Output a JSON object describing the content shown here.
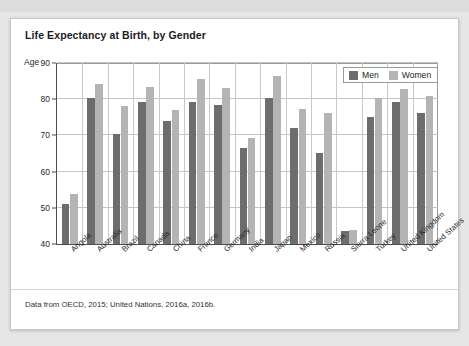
{
  "card": {
    "title": "Life Expectancy at Birth, by Gender",
    "footnote": "Data from OECD, 2015; United Nations, 2016a, 2016b."
  },
  "legend": {
    "items": [
      {
        "label": "Men",
        "color": "#6d6d6d"
      },
      {
        "label": "Women",
        "color": "#b4b4b4"
      }
    ]
  },
  "axis": {
    "y_label": "Age",
    "y_ticks": [
      "90",
      "80",
      "70",
      "60",
      "50",
      "40"
    ]
  },
  "chart_data": {
    "type": "bar",
    "title": "Life Expectancy at Birth, by Gender",
    "xlabel": "",
    "ylabel": "Age",
    "ylim": [
      40,
      90
    ],
    "yticks": [
      40,
      50,
      60,
      70,
      80,
      90
    ],
    "grid": true,
    "legend_position": "top-right",
    "categories": [
      "Angola",
      "Australia",
      "Brazil",
      "Canada",
      "China",
      "France",
      "Germany",
      "India",
      "Japan",
      "Mexico",
      "Russia",
      "Sierra Leone",
      "Turkey",
      "United Kingdom",
      "United States"
    ],
    "series": [
      {
        "name": "Men",
        "color": "#6d6d6d",
        "values": [
          51.0,
          80.2,
          70.5,
          79.2,
          74.1,
          79.2,
          78.5,
          66.4,
          80.3,
          72.1,
          65.2,
          43.6,
          75.0,
          79.2,
          76.1
        ]
      },
      {
        "name": "Women",
        "color": "#b4b4b4",
        "values": [
          53.8,
          84.2,
          78.1,
          83.3,
          77.0,
          85.6,
          83.2,
          69.2,
          86.4,
          77.4,
          76.1,
          43.8,
          80.3,
          82.8,
          81.0
        ]
      }
    ],
    "annotations": [
      "Data from OECD, 2015; United Nations, 2016a, 2016b."
    ]
  }
}
